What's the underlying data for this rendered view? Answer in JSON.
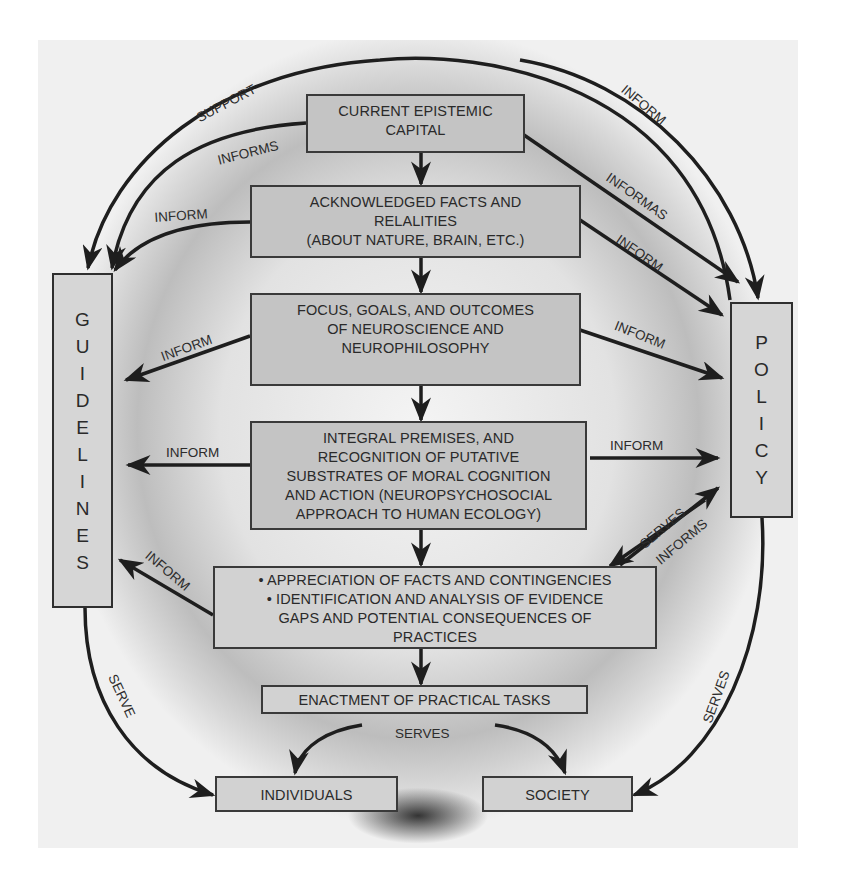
{
  "diagram": {
    "nodes": {
      "epistemic_capital": {
        "lines": [
          "CURRENT EPISTEMIC",
          "CAPITAL"
        ]
      },
      "facts": {
        "lines": [
          "ACKNOWLEDGED FACTS AND",
          "RELALITIES",
          "(ABOUT NATURE, BRAIN, ETC.)"
        ]
      },
      "focus": {
        "lines": [
          "FOCUS, GOALS, AND OUTCOMES",
          "OF NEUROSCIENCE AND",
          "NEUROPHILOSOPHY"
        ]
      },
      "premises": {
        "lines": [
          "INTEGRAL PREMISES, AND",
          "RECOGNITION OF PUTATIVE",
          "SUBSTRATES OF MORAL COGNITION",
          "AND ACTION (NEUROPSYCHOSOCIAL",
          "APPROACH TO HUMAN ECOLOGY)"
        ]
      },
      "appreciation": {
        "lines": [
          "• APPRECIATION OF FACTS AND CONTINGENCIES",
          "• IDENTIFICATION AND ANALYSIS OF EVIDENCE",
          "GAPS AND POTENTIAL CONSEQUENCES OF",
          "PRACTICES"
        ]
      },
      "enactment": {
        "lines": [
          "ENACTMENT OF PRACTICAL TASKS"
        ]
      },
      "individuals": {
        "lines": [
          "INDIVIDUALS"
        ]
      },
      "society": {
        "lines": [
          "SOCIETY"
        ]
      },
      "guidelines": {
        "letters": [
          "G",
          "U",
          "I",
          "D",
          "E",
          "L",
          "I",
          "N",
          "E",
          "S"
        ]
      },
      "policy": {
        "letters": [
          "P",
          "O",
          "L",
          "I",
          "C",
          "Y"
        ]
      }
    },
    "edge_labels": {
      "support": "SUPPORT",
      "informs_top": "INFORMS",
      "inform_top_right": "INFORM",
      "informas": "INFORMAS",
      "inform_facts_left": "INFORM",
      "inform_facts_right": "INFORM",
      "inform_focus_left": "INFORM",
      "inform_focus_right": "INFORM",
      "inform_premises_left": "INFORM",
      "inform_premises_right": "INFORM",
      "inform_appreciation_left": "INFORM",
      "serves_policy": "SERVES",
      "informs_policy": "INFORMS",
      "serve_left": "SERVE",
      "serves_right": "SERVES",
      "serves_bottom": "SERVES"
    }
  }
}
